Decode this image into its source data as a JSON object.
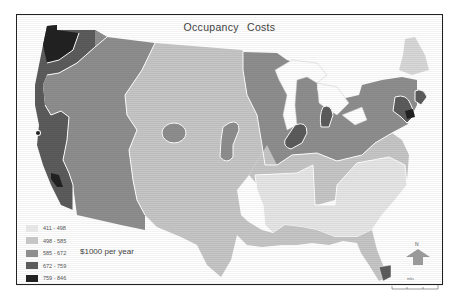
{
  "title": "Occupancy  Costs",
  "unit_label": "$1000 per  year",
  "legend": [
    {
      "label": "411 - 498",
      "color": "#e6e6e6"
    },
    {
      "label": "498 - 585",
      "color": "#c6c6c6"
    },
    {
      "label": "585 - 672",
      "color": "#8e8e8e"
    },
    {
      "label": "672 - 759",
      "color": "#5c5c5c"
    },
    {
      "label": "759 - 846",
      "color": "#222222"
    }
  ],
  "north_arrow": {
    "label": "N"
  },
  "scale_bar": {
    "label": "miles"
  },
  "colors": {
    "frame": "#222222",
    "boundary": "#ffffff",
    "class1": "#e6e6e6",
    "class2": "#c6c6c6",
    "class3": "#8e8e8e",
    "class4": "#5c5c5c",
    "class5": "#222222"
  }
}
